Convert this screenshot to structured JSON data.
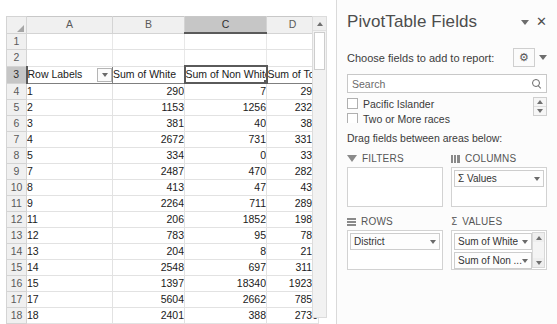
{
  "grid": {
    "column_headers": [
      "A",
      "B",
      "C",
      "D"
    ],
    "selected_column": "C",
    "selected_row": "3",
    "selected_cell": "C3",
    "row_numbers": [
      "1",
      "2",
      "3",
      "4",
      "5",
      "6",
      "7",
      "8",
      "9",
      "10",
      "11",
      "12",
      "13",
      "14",
      "15",
      "16",
      "17",
      "18"
    ],
    "table_headers": [
      "Row Labels",
      "Sum of White",
      "Sum of Non White",
      "Sum of Total"
    ],
    "rows": [
      {
        "label": "1",
        "white": "290",
        "non_white": "7",
        "total": "290"
      },
      {
        "label": "2",
        "white": "1153",
        "non_white": "1256",
        "total": "2327"
      },
      {
        "label": "3",
        "white": "381",
        "non_white": "40",
        "total": "387"
      },
      {
        "label": "4",
        "white": "2672",
        "non_white": "731",
        "total": "3314"
      },
      {
        "label": "5",
        "white": "334",
        "non_white": "0",
        "total": "334"
      },
      {
        "label": "7",
        "white": "2487",
        "non_white": "470",
        "total": "2824"
      },
      {
        "label": "8",
        "white": "413",
        "non_white": "47",
        "total": "435"
      },
      {
        "label": "9",
        "white": "2264",
        "non_white": "711",
        "total": "2899"
      },
      {
        "label": "11",
        "white": "206",
        "non_white": "1852",
        "total": "1986"
      },
      {
        "label": "12",
        "white": "783",
        "non_white": "95",
        "total": "789"
      },
      {
        "label": "13",
        "white": "204",
        "non_white": "8",
        "total": "210"
      },
      {
        "label": "14",
        "white": "2548",
        "non_white": "697",
        "total": "3119"
      },
      {
        "label": "15",
        "white": "1397",
        "non_white": "18340",
        "total": "19236"
      },
      {
        "label": "17",
        "white": "5604",
        "non_white": "2662",
        "total": "7852"
      },
      {
        "label": "18",
        "white": "2401",
        "non_white": "388",
        "total": "2730"
      }
    ]
  },
  "pane": {
    "title": "PivotTable Fields",
    "collapse_icon": "chevron-down-icon",
    "close_icon": "close-icon",
    "close_label": "✕",
    "choose_label": "Choose fields to add to report:",
    "gear_icon": "gear-icon",
    "gear_glyph": "⚙",
    "search": {
      "value": "",
      "placeholder": "Search",
      "icon": "search-icon"
    },
    "field_list": [
      {
        "label": "Pacific Islander",
        "checked": false
      },
      {
        "label": "Two or More races",
        "checked": false
      }
    ],
    "drag_label": "Drag fields between areas below:",
    "areas": [
      {
        "name": "FILTERS",
        "icon": "filter-icon",
        "chips": []
      },
      {
        "name": "COLUMNS",
        "icon": "columns-icon",
        "chips": [
          {
            "label": "Σ Values"
          }
        ]
      },
      {
        "name": "ROWS",
        "icon": "rows-icon",
        "chips": [
          {
            "label": "District"
          }
        ]
      },
      {
        "name": "VALUES",
        "icon": "sigma-icon",
        "chips": [
          {
            "label": "Sum of White"
          },
          {
            "label": "Sum of Non ..."
          },
          {
            "label": "Sum of Total"
          }
        ]
      }
    ]
  },
  "colors": {
    "header_gray": "#f0f0f0",
    "selection_gray": "#c6c6c6",
    "selection_border": "#5a5a5a",
    "grid_line": "#e2e2e2",
    "pane_bg": "#fcfcfc",
    "title_text": "#4d4d4d"
  }
}
